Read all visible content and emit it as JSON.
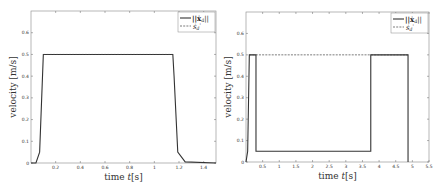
{
  "chart_data": [
    {
      "type": "line",
      "title": "",
      "xlabel": "time t[s]",
      "ylabel": "velocity [m/s]",
      "xlim": [
        0,
        1.5
      ],
      "ylim": [
        0,
        0.7
      ],
      "xticks": [
        "0.2",
        "0.4",
        "0.6",
        "0.8",
        "1",
        "1.2",
        "1.4"
      ],
      "yticks": [
        "0",
        "0.1",
        "0.2",
        "0.3",
        "0.4",
        "0.5",
        "0.6"
      ],
      "grid": false,
      "legend_position": "top-right",
      "series": [
        {
          "name": "||ẋ_d||",
          "style": "solid",
          "x": [
            0,
            0.04,
            0.07,
            0.1,
            0.1,
            1.15,
            1.16,
            1.19,
            1.25,
            1.5
          ],
          "y": [
            0,
            0,
            0.05,
            0.5,
            0.5,
            0.5,
            0.4,
            0.05,
            0.005,
            0
          ]
        },
        {
          "name": "ṡ_d'",
          "style": "dashed",
          "x": [
            0.1,
            1.15
          ],
          "y": [
            0.5,
            0.5
          ]
        }
      ]
    },
    {
      "type": "line",
      "title": "",
      "xlabel": "time t[s]",
      "ylabel": "velocity [m/s]",
      "xlim": [
        0,
        5.5
      ],
      "ylim": [
        0,
        0.7
      ],
      "xticks": [
        "0.5",
        "1",
        "1.5",
        "2",
        "2.5",
        "3",
        "3.5",
        "4",
        "4.5",
        "5",
        "5.5"
      ],
      "yticks": [
        "0",
        "0.1",
        "0.2",
        "0.3",
        "0.4",
        "0.5",
        "0.6"
      ],
      "grid": false,
      "legend_position": "top-right",
      "series": [
        {
          "name": "||ẋ_d||",
          "style": "solid",
          "x": [
            0,
            0.05,
            0.1,
            0.3,
            0.3,
            3.75,
            3.75,
            4.87,
            4.87
          ],
          "y": [
            0,
            0.05,
            0.5,
            0.5,
            0.05,
            0.05,
            0.5,
            0.5,
            0
          ]
        },
        {
          "name": "ṡ_d'",
          "style": "dashed",
          "x": [
            0.1,
            4.87
          ],
          "y": [
            0.5,
            0.5
          ]
        }
      ]
    }
  ],
  "legend": {
    "solid": "||ẋ",
    "solid_sub": "d",
    "solid_end": "||",
    "dashed": "ṡ",
    "dashed_sub": "d",
    "dashed_end": "'"
  },
  "labels": {
    "x": "time ",
    "x_var": "t",
    "x_unit": "[s]",
    "y": "velocity [m/s]"
  }
}
